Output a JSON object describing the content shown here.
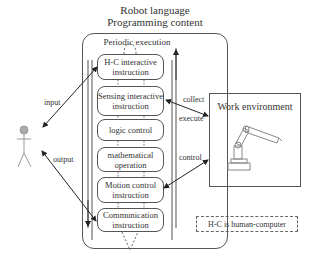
{
  "title": {
    "line1": "Robot language",
    "line2": "Programming content"
  },
  "container": {
    "label": "Periodic execution"
  },
  "instructions": [
    {
      "label": "H-C interactive instruction"
    },
    {
      "label": "Sensing interactive instruction"
    },
    {
      "label": "logic control"
    },
    {
      "label": "mathematical operation"
    },
    {
      "label": "Motion control instruction"
    },
    {
      "label": "Communication instruction"
    }
  ],
  "human": {
    "icon": "stick-figure-icon",
    "input_label": "input",
    "output_label": "output"
  },
  "work_environment": {
    "title": "Work environment",
    "icon": "robot-arm-icon",
    "collect_label": "collect",
    "execute_label": "execute",
    "control_label": "control"
  },
  "legend": {
    "text": "H-C is human-computer"
  }
}
